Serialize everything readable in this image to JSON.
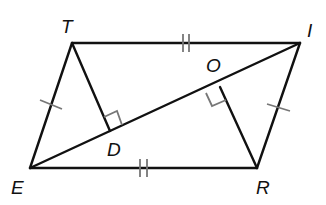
{
  "diagram": {
    "type": "geometry-parallelogram",
    "colors": {
      "line": "#111111",
      "marker": "#777777",
      "background": "#ffffff"
    },
    "vertices": {
      "T": {
        "label": "T",
        "x": 72,
        "y": 43
      },
      "I": {
        "label": "I",
        "x": 300,
        "y": 43
      },
      "E": {
        "label": "E",
        "x": 30,
        "y": 168
      },
      "R": {
        "label": "R",
        "x": 257,
        "y": 168
      },
      "D": {
        "label": "D",
        "x": 110,
        "y": 131
      },
      "O": {
        "label": "O",
        "x": 220,
        "y": 87
      }
    },
    "segments": [
      "TI",
      "ER",
      "TE",
      "IR",
      "EI",
      "TD",
      "RO"
    ],
    "congruence_marks": [
      {
        "segments": [
          "TI",
          "ER"
        ],
        "ticks": 2
      },
      {
        "segments": [
          "TE",
          "IR"
        ],
        "ticks": 1
      }
    ],
    "right_angles": [
      "TDI",
      "ROE"
    ]
  }
}
